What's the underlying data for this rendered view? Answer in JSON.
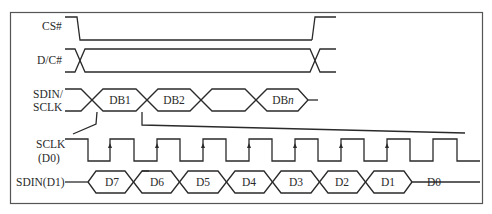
{
  "diagram": {
    "title": "",
    "signals": [
      {
        "id": "cs",
        "label": "CS#"
      },
      {
        "id": "dc",
        "label": "D/C#"
      },
      {
        "id": "sdin_sclk",
        "label_lines": [
          "SDIN/",
          "SCLK"
        ]
      },
      {
        "id": "sclk",
        "label_lines": [
          "SCLK",
          "(D0)"
        ]
      },
      {
        "id": "sdin_d1",
        "label": "SDIN(D1)"
      }
    ],
    "byte_bus": {
      "segments": [
        "DB1",
        "DB2",
        "",
        "DBn"
      ]
    },
    "bit_bus": {
      "segments": [
        "D7",
        "D6",
        "D5",
        "D4",
        "D3",
        "D2",
        "D1",
        "D0"
      ]
    },
    "sclk_rising_edge_markers": 7,
    "zoom_annotation": "DB1 expanded into bits D7..D0"
  }
}
